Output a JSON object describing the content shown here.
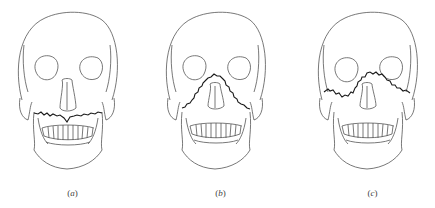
{
  "figure": {
    "line_color": "#555555",
    "fracture_color": "#1a1a1a",
    "background": "#ffffff",
    "panels": [
      {
        "id": "a",
        "label": "a",
        "fracture": "horizontal line across maxilla above teeth"
      },
      {
        "id": "b",
        "label": "b",
        "fracture": "pyramidal line through nasal bridge and lateral maxilla"
      },
      {
        "id": "c",
        "label": "c",
        "fracture": "transverse line through orbits and zygomatic arches"
      }
    ]
  }
}
